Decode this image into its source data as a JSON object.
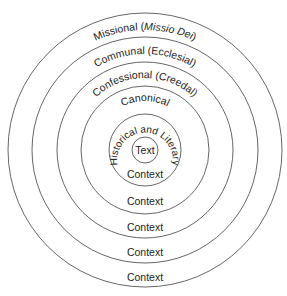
{
  "diagram": {
    "type": "concentric-circles",
    "colors": {
      "stroke": "#555555",
      "text": "#222222",
      "background": "#ffffff"
    },
    "center_label": "Text",
    "rings": [
      {
        "label_main": "Historical and Literary",
        "label_italic": "",
        "label_suffix": "",
        "bottom_label": "Context"
      },
      {
        "label_main": "Canonical",
        "label_italic": "",
        "label_suffix": "",
        "bottom_label": "Context"
      },
      {
        "label_main": "Confessional (Creedal)",
        "label_italic": "",
        "label_suffix": "",
        "bottom_label": "Context"
      },
      {
        "label_main": "Communal (Ecclesial)",
        "label_italic": "",
        "label_suffix": "",
        "bottom_label": "Context"
      },
      {
        "label_main": "Missional (",
        "label_italic": "Missio Dei",
        "label_suffix": ")",
        "bottom_label": "Context"
      }
    ]
  }
}
